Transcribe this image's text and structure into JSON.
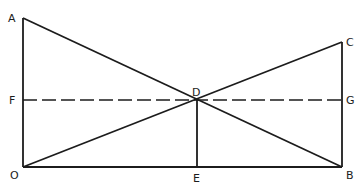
{
  "diagram": {
    "points": {
      "A": {
        "label": "A",
        "x": 23,
        "y": 18
      },
      "B": {
        "label": "B",
        "x": 342,
        "y": 167
      },
      "C": {
        "label": "C",
        "x": 342,
        "y": 42
      },
      "D": {
        "label": "D",
        "x": 197,
        "y": 100
      },
      "E": {
        "label": "E",
        "x": 197,
        "y": 167
      },
      "F": {
        "label": "F",
        "x": 23,
        "y": 100
      },
      "G": {
        "label": "G",
        "x": 342,
        "y": 100
      },
      "O": {
        "label": "O",
        "x": 23,
        "y": 167
      }
    },
    "segments": [
      {
        "from": "O",
        "to": "A",
        "style": "solid"
      },
      {
        "from": "O",
        "to": "B",
        "style": "solid"
      },
      {
        "from": "B",
        "to": "C",
        "style": "solid"
      },
      {
        "from": "A",
        "to": "B",
        "style": "solid"
      },
      {
        "from": "O",
        "to": "C",
        "style": "solid"
      },
      {
        "from": "D",
        "to": "E",
        "style": "solid"
      },
      {
        "from": "F",
        "to": "G",
        "style": "dashed"
      }
    ],
    "colors": {
      "stroke": "#1c1c1c",
      "background": "#ffffff"
    }
  }
}
